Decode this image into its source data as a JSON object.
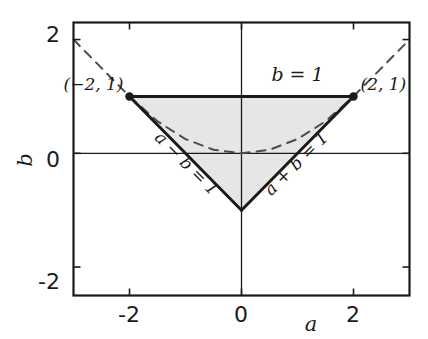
{
  "chart_data": {
    "type": "line",
    "title": "",
    "xlabel": "a",
    "ylabel": "b",
    "xlim": [
      -3,
      3
    ],
    "ylim": [
      -2.5,
      2.3
    ],
    "grid": false,
    "legend": "none",
    "xticks": [
      -2,
      0,
      2
    ],
    "xticklabels": [
      "-2",
      "0",
      "2"
    ],
    "yticks": [
      -2,
      0,
      2
    ],
    "yticklabels": [
      "-2",
      "0",
      "2"
    ],
    "series": [
      {
        "name": "b = 1",
        "kind": "segment",
        "style": "solid",
        "points": [
          [
            -2,
            1
          ],
          [
            2,
            1
          ]
        ]
      },
      {
        "name": "a - b = 1",
        "kind": "segment",
        "style": "solid",
        "points": [
          [
            -2,
            1
          ],
          [
            0,
            -1
          ]
        ]
      },
      {
        "name": "a + b = 1",
        "kind": "segment",
        "style": "solid",
        "points": [
          [
            0,
            -1
          ],
          [
            2,
            1
          ]
        ]
      },
      {
        "name": "a - b = 1 extension",
        "kind": "segment",
        "style": "dashed",
        "points": [
          [
            -3,
            2
          ],
          [
            -2,
            1
          ]
        ]
      },
      {
        "name": "a + b = 1 extension",
        "kind": "segment",
        "style": "dashed",
        "points": [
          [
            2,
            1
          ],
          [
            3,
            2
          ]
        ]
      },
      {
        "name": "discriminant curve b = a^2/4",
        "kind": "curve",
        "style": "dashed",
        "points": [
          [
            -2,
            1
          ],
          [
            -1.5,
            0.5625
          ],
          [
            -1,
            0.25
          ],
          [
            -0.5,
            0.0625
          ],
          [
            0,
            0
          ],
          [
            0.5,
            0.0625
          ],
          [
            1,
            0.25
          ],
          [
            1.5,
            0.5625
          ],
          [
            2,
            1
          ]
        ]
      }
    ],
    "shaded_region": {
      "name": "feasible triangle",
      "vertices": [
        [
          -2,
          1
        ],
        [
          2,
          1
        ],
        [
          0,
          -1
        ]
      ],
      "fill": "#e6e6e6"
    },
    "markers": [
      {
        "name": "vertex-left",
        "point": [
          -2,
          1
        ]
      },
      {
        "name": "vertex-right",
        "point": [
          2,
          1
        ]
      }
    ],
    "annotations": [
      {
        "name": "point-label-left",
        "text": "(−2, 1)",
        "at": [
          -2,
          1
        ],
        "placement": "left-above"
      },
      {
        "name": "point-label-right",
        "text": "(2, 1)",
        "at": [
          2,
          1
        ],
        "placement": "right-above"
      },
      {
        "name": "line-label-top",
        "text": "b = 1",
        "at": [
          1.0,
          1.28
        ],
        "rotation": 0
      },
      {
        "name": "line-label-left-diagonal",
        "text": "a − b = 1",
        "at": [
          -1.05,
          -0.25
        ],
        "rotation": 45
      },
      {
        "name": "line-label-right-diagonal",
        "text": "a + b = 1",
        "at": [
          1.05,
          -0.25
        ],
        "rotation": -45
      }
    ]
  },
  "axes": {
    "x_axis_label": "a",
    "y_axis_label": "b",
    "x_tick_labels": [
      "-2",
      "0",
      "2"
    ],
    "y_tick_labels": [
      "2",
      "0",
      "-2"
    ]
  },
  "colors": {
    "line": "#1a1a1a",
    "frame": "#1a1a1a",
    "fill": "#e6e6e6",
    "dashed": "#4d4d4d",
    "background": "#ffffff"
  }
}
